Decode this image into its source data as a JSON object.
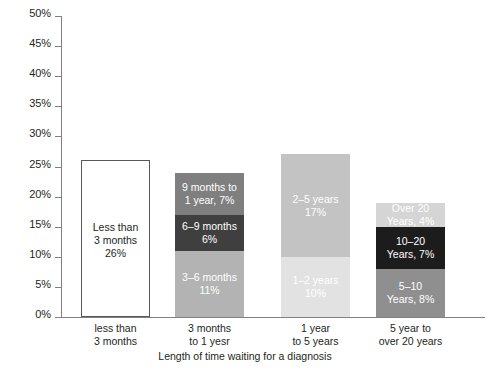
{
  "chart_data": {
    "type": "bar",
    "title": "",
    "subtitle": "",
    "xlabel": "Length of time waiting for a diagnosis",
    "ylabel": "",
    "ylim": [
      0,
      50
    ],
    "ytick_labels": [
      "50%",
      "45%",
      "40%",
      "35%",
      "30%",
      "25%",
      "20%",
      "15%",
      "10%",
      "5%",
      "0%"
    ],
    "ytick_values": [
      50,
      45,
      40,
      35,
      30,
      25,
      20,
      15,
      10,
      5,
      0
    ],
    "grid": false,
    "legend": "none",
    "stacked": true,
    "categories": [
      "less than\n3 months",
      "3 months\nto 1 yesr",
      "1 year\nto 5 years",
      "5 year to\nover 20 years"
    ],
    "bars": [
      {
        "category": "less than\n3 months",
        "total": 26,
        "outlined": true,
        "segments": [
          {
            "label": "Less than\n3 months\n26%",
            "value": 26,
            "color": "#ffffff",
            "text_color": "dark"
          }
        ]
      },
      {
        "category": "3 months\nto 1 yesr",
        "total": 24,
        "outlined": false,
        "segments": [
          {
            "label": "3–6 months\n11%",
            "value": 11,
            "color": "#b3b3b3",
            "text_color": "light"
          },
          {
            "label": "6–9 months\n6%",
            "value": 6,
            "color": "#3f3f3f",
            "text_color": "light"
          },
          {
            "label": "9 months to\n1 year, 7%",
            "value": 7,
            "color": "#7f7f7f",
            "text_color": "light"
          }
        ]
      },
      {
        "category": "1 year\nto 5 years",
        "total": 27,
        "outlined": false,
        "segments": [
          {
            "label": "1–2 years\n10%",
            "value": 10,
            "color": "#e2e2e2",
            "text_color": "light"
          },
          {
            "label": "2–5 years\n17%",
            "value": 17,
            "color": "#c3c3c3",
            "text_color": "light"
          }
        ]
      },
      {
        "category": "5 year to\nover 20 years",
        "total": 19,
        "outlined": false,
        "segments": [
          {
            "label": "5–10\nYears, 8%",
            "value": 8,
            "color": "#8f8f8f",
            "text_color": "light"
          },
          {
            "label": "10–20\nYears, 7%",
            "value": 7,
            "color": "#1c1c1c",
            "text_color": "light"
          },
          {
            "label": "Over 20\nYears, 4%",
            "value": 4,
            "color": "#d5d5d5",
            "text_color": "light"
          }
        ]
      }
    ],
    "axis_color": "#808080",
    "text_color": "#231f20"
  }
}
